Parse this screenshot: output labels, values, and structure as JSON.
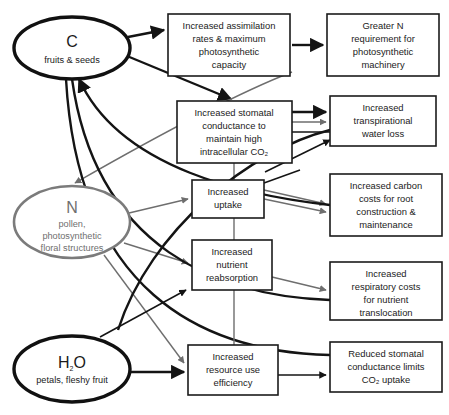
{
  "diagram": {
    "canvas": {
      "width": 449,
      "height": 415,
      "background": "#ffffff"
    },
    "colors": {
      "black": "#141414",
      "gray": "#6e6e6e",
      "box_stroke": "#1b1b1b",
      "background": "#ffffff"
    },
    "resource_nodes": [
      {
        "id": "carbon",
        "symbol": "C",
        "subtitle": "fruits & seeds",
        "style": "thick-black",
        "cx": 72,
        "cy": 48,
        "rx": 58,
        "ry": 31
      },
      {
        "id": "nitrogen",
        "symbol": "N",
        "subtitle_lines": [
          "pollen,",
          "photosynthetic",
          "floral structures"
        ],
        "style": "gray",
        "cx": 72,
        "cy": 222,
        "rx": 58,
        "ry": 36
      },
      {
        "id": "water",
        "symbol_main": "H",
        "symbol_sub": "2",
        "symbol_tail": "O",
        "subtitle": "petals, fleshy fruit",
        "style": "thick-black",
        "cx": 72,
        "cy": 369,
        "rx": 58,
        "ry": 33
      }
    ],
    "process_boxes": [
      {
        "id": "assimilation",
        "lines": [
          "Increased assimilation",
          "rates & maximum",
          "photosynthetic",
          "capacity"
        ],
        "x": 168,
        "y": 14,
        "w": 122,
        "h": 62
      },
      {
        "id": "greater-n",
        "lines": [
          "Greater N",
          "requirement for",
          "photosynthetic",
          "machinery"
        ],
        "x": 327,
        "y": 14,
        "w": 112,
        "h": 62
      },
      {
        "id": "stomatal-conductance",
        "lines": [
          "Increased stomatal",
          "conductance to",
          "maintain high",
          "intracellular CO₂"
        ],
        "x": 177,
        "y": 101,
        "w": 115,
        "h": 62
      },
      {
        "id": "transpirational-loss",
        "lines": [
          "Increased",
          "transpirational",
          "water loss"
        ],
        "x": 330,
        "y": 96,
        "w": 106,
        "h": 50
      },
      {
        "id": "increased-uptake",
        "lines": [
          "Increased",
          "uptake"
        ],
        "x": 192,
        "y": 180,
        "w": 72,
        "h": 38
      },
      {
        "id": "carbon-costs-root",
        "lines": [
          "Increased carbon",
          "costs for root",
          "construction &",
          "maintenance"
        ],
        "x": 330,
        "y": 174,
        "w": 112,
        "h": 62
      },
      {
        "id": "nutrient-reabsorption",
        "lines": [
          "Increased",
          "nutrient",
          "reabsorption"
        ],
        "x": 192,
        "y": 240,
        "w": 80,
        "h": 50
      },
      {
        "id": "respiratory-costs",
        "lines": [
          "Increased",
          "respiratory costs",
          "for nutrient",
          "translocation"
        ],
        "x": 330,
        "y": 262,
        "w": 112,
        "h": 58
      },
      {
        "id": "resource-use-efficiency",
        "lines": [
          "Increased",
          "resource use",
          "efficiency"
        ],
        "x": 188,
        "y": 345,
        "w": 90,
        "h": 50
      },
      {
        "id": "reduced-stomatal",
        "lines": [
          "Reduced stomatal",
          "conductance limits",
          "CO₂ uptake"
        ],
        "x": 330,
        "y": 342,
        "w": 112,
        "h": 50
      }
    ],
    "edges": [
      {
        "id": "c-to-assimilation",
        "from": "carbon",
        "to": "assimilation",
        "color": "black",
        "weight": "thick"
      },
      {
        "id": "c-to-stomatal",
        "from": "carbon",
        "to": "stomatal-conductance",
        "color": "black",
        "weight": "thick"
      },
      {
        "id": "assimilation-to-greater-n",
        "from": "assimilation",
        "to": "greater-n",
        "color": "black",
        "weight": "thick"
      },
      {
        "id": "assimilation-to-n",
        "from": "assimilation",
        "to": "nitrogen",
        "color": "gray",
        "weight": "thin"
      },
      {
        "id": "stomatal-to-transpiration-a",
        "from": "stomatal-conductance",
        "to": "transpirational-loss",
        "color": "black",
        "weight": "thick"
      },
      {
        "id": "stomatal-to-transpiration-b",
        "from": "stomatal-conductance",
        "to": "transpirational-loss",
        "color": "gray",
        "weight": "thin"
      },
      {
        "id": "transpiration-to-uptake",
        "from": "transpirational-loss",
        "to": "increased-uptake",
        "color": "black",
        "weight": "thin"
      },
      {
        "id": "n-to-uptake",
        "from": "nitrogen",
        "to": "increased-uptake",
        "color": "gray",
        "weight": "thin"
      },
      {
        "id": "n-to-reabsorption",
        "from": "nitrogen",
        "to": "nutrient-reabsorption",
        "color": "gray",
        "weight": "thin"
      },
      {
        "id": "n-to-efficiency",
        "from": "nitrogen",
        "to": "resource-use-efficiency",
        "color": "gray",
        "weight": "thin"
      },
      {
        "id": "uptake-to-carbon-costs-a",
        "from": "increased-uptake",
        "to": "carbon-costs-root",
        "color": "gray",
        "weight": "thin"
      },
      {
        "id": "uptake-to-carbon-costs-b",
        "from": "increased-uptake",
        "to": "carbon-costs-root",
        "color": "gray",
        "weight": "thin"
      },
      {
        "id": "reabsorption-to-respiratory",
        "from": "nutrient-reabsorption",
        "to": "respiratory-costs",
        "color": "gray",
        "weight": "thin"
      },
      {
        "id": "h2o-to-efficiency",
        "from": "water",
        "to": "resource-use-efficiency",
        "color": "black",
        "weight": "thick"
      },
      {
        "id": "h2o-to-reduced-stomatal",
        "from": "water",
        "to": "reduced-stomatal",
        "color": "black",
        "weight": "thin"
      },
      {
        "id": "efficiency-to-reduced-stomatal",
        "from": "resource-use-efficiency",
        "to": "reduced-stomatal",
        "color": "black",
        "weight": "thin"
      },
      {
        "id": "carbon-costs-to-c",
        "from": "carbon-costs-root",
        "to": "carbon",
        "color": "black",
        "weight": "thick"
      },
      {
        "id": "respiratory-to-c",
        "from": "respiratory-costs",
        "to": "carbon",
        "color": "black",
        "weight": "thick"
      },
      {
        "id": "reduced-stomatal-to-c",
        "from": "reduced-stomatal",
        "to": "carbon",
        "color": "black",
        "weight": "thick"
      },
      {
        "id": "transpiration-to-h2o",
        "from": "transpirational-loss",
        "to": "water",
        "color": "black",
        "weight": "thick"
      }
    ]
  }
}
